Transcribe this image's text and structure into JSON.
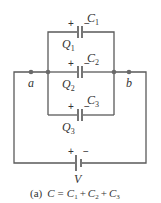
{
  "diagram": {
    "type": "circuit",
    "capacitors": [
      {
        "name": "C",
        "sub": "1",
        "charge": "Q",
        "charge_sub": "1",
        "plus": "+",
        "minus": "−"
      },
      {
        "name": "C",
        "sub": "2",
        "charge": "Q",
        "charge_sub": "2",
        "plus": "+",
        "minus": "−"
      },
      {
        "name": "C",
        "sub": "3",
        "charge": "Q",
        "charge_sub": "3",
        "plus": "+",
        "minus": "−"
      }
    ],
    "nodes": {
      "a": "a",
      "b": "b"
    },
    "battery": {
      "label": "V",
      "plus": "+",
      "minus": "−"
    },
    "caption": {
      "prefix": "(a)",
      "lhs": "C",
      "eq": "=",
      "terms": [
        {
          "name": "C",
          "sub": "1"
        },
        {
          "name": "C",
          "sub": "2"
        },
        {
          "name": "C",
          "sub": "3"
        }
      ],
      "op": "+"
    }
  }
}
